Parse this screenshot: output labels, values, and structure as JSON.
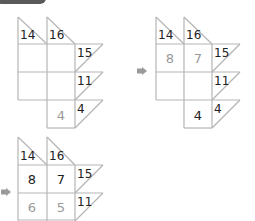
{
  "header": {
    "tab_label": ""
  },
  "colors": {
    "line": "#b5b5b5",
    "given": "#222222",
    "entered": "#9a9a9a",
    "arrow": "#9a9a9a"
  },
  "steps": [
    {
      "col_clues": [
        "14",
        "16"
      ],
      "row_clues": [
        "15",
        "11",
        "4"
      ],
      "cells": [
        [
          "",
          ""
        ],
        [
          "",
          ""
        ],
        [
          null,
          "4"
        ]
      ],
      "cell_styles": [
        [
          "",
          ""
        ],
        [
          "",
          ""
        ],
        [
          null,
          "entered"
        ]
      ]
    },
    {
      "col_clues": [
        "14",
        "16"
      ],
      "row_clues": [
        "15",
        "11",
        "4"
      ],
      "cells": [
        [
          "8",
          "7"
        ],
        [
          "",
          ""
        ],
        [
          null,
          "4"
        ]
      ],
      "cell_styles": [
        [
          "entered",
          "entered"
        ],
        [
          "",
          ""
        ],
        [
          null,
          "given"
        ]
      ]
    },
    {
      "col_clues": [
        "14",
        "16"
      ],
      "row_clues": [
        "15",
        "11"
      ],
      "cells": [
        [
          "8",
          "7"
        ],
        [
          "6",
          "5"
        ]
      ],
      "cell_styles": [
        [
          "given",
          "given"
        ],
        [
          "entered",
          "entered"
        ]
      ]
    }
  ]
}
